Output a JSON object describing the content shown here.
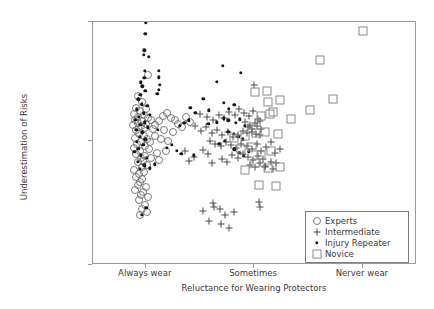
{
  "chart_data": {
    "type": "scatter",
    "title": "",
    "xlabel": "Reluctance for Wearing Protectors",
    "ylabel": "Underestimation of Risks",
    "xticklabels": [
      "Always wear",
      "Sometimes",
      "Nerver wear"
    ],
    "xtickpos": [
      0.163,
      0.497,
      0.833
    ],
    "yticklabels": [
      "Don't care",
      "So-so",
      "Very Careful"
    ],
    "ytickpos": [
      1.0,
      0.51,
      0.0
    ],
    "xlim": [
      0,
      1
    ],
    "ylim": [
      0,
      1
    ],
    "grid": false,
    "legend_position": "bottom-right",
    "series": [
      {
        "name": "Experts",
        "marker": "open-circle",
        "color": "#7a7a7a",
        "points": [
          [
            0.17,
            0.78
          ],
          [
            0.14,
            0.695
          ],
          [
            0.152,
            0.672
          ],
          [
            0.133,
            0.648
          ],
          [
            0.163,
            0.64
          ],
          [
            0.146,
            0.632
          ],
          [
            0.128,
            0.622
          ],
          [
            0.158,
            0.618
          ],
          [
            0.14,
            0.61
          ],
          [
            0.171,
            0.606
          ],
          [
            0.131,
            0.598
          ],
          [
            0.152,
            0.592
          ],
          [
            0.138,
            0.585
          ],
          [
            0.165,
            0.58
          ],
          [
            0.124,
            0.576
          ],
          [
            0.147,
            0.57
          ],
          [
            0.16,
            0.562
          ],
          [
            0.134,
            0.556
          ],
          [
            0.179,
            0.598
          ],
          [
            0.192,
            0.578
          ],
          [
            0.186,
            0.56
          ],
          [
            0.205,
            0.592
          ],
          [
            0.215,
            0.612
          ],
          [
            0.228,
            0.626
          ],
          [
            0.24,
            0.604
          ],
          [
            0.253,
            0.596
          ],
          [
            0.262,
            0.58
          ],
          [
            0.275,
            0.566
          ],
          [
            0.288,
            0.61
          ],
          [
            0.3,
            0.588
          ],
          [
            0.143,
            0.54
          ],
          [
            0.156,
            0.532
          ],
          [
            0.129,
            0.524
          ],
          [
            0.168,
            0.518
          ],
          [
            0.148,
            0.508
          ],
          [
            0.136,
            0.498
          ],
          [
            0.159,
            0.49
          ],
          [
            0.126,
            0.482
          ],
          [
            0.172,
            0.476
          ],
          [
            0.145,
            0.468
          ],
          [
            0.133,
            0.456
          ],
          [
            0.16,
            0.45
          ],
          [
            0.147,
            0.44
          ],
          [
            0.155,
            0.43
          ],
          [
            0.138,
            0.422
          ],
          [
            0.166,
            0.412
          ],
          [
            0.15,
            0.402
          ],
          [
            0.128,
            0.392
          ],
          [
            0.158,
            0.384
          ],
          [
            0.142,
            0.374
          ],
          [
            0.133,
            0.362
          ],
          [
            0.152,
            0.352
          ],
          [
            0.146,
            0.34
          ],
          [
            0.139,
            0.33
          ],
          [
            0.163,
            0.322
          ],
          [
            0.131,
            0.31
          ],
          [
            0.155,
            0.3
          ],
          [
            0.148,
            0.288
          ],
          [
            0.169,
            0.278
          ],
          [
            0.141,
            0.268
          ],
          [
            0.21,
            0.52
          ],
          [
            0.232,
            0.512
          ],
          [
            0.248,
            0.546
          ],
          [
            0.196,
            0.462
          ],
          [
            0.225,
            0.47
          ],
          [
            0.18,
            0.44
          ],
          [
            0.204,
            0.432
          ],
          [
            0.175,
            0.506
          ],
          [
            0.19,
            0.53
          ],
          [
            0.218,
            0.554
          ],
          [
            0.16,
            0.248
          ],
          [
            0.15,
            0.232
          ],
          [
            0.168,
            0.22
          ],
          [
            0.145,
            0.206
          ]
        ]
      },
      {
        "name": "Intermediate",
        "marker": "plus",
        "color": "#4a4a4a",
        "points": [
          [
            0.498,
            0.74
          ],
          [
            0.33,
            0.62
          ],
          [
            0.352,
            0.608
          ],
          [
            0.37,
            0.596
          ],
          [
            0.388,
            0.616
          ],
          [
            0.405,
            0.604
          ],
          [
            0.42,
            0.63
          ],
          [
            0.438,
            0.618
          ],
          [
            0.452,
            0.64
          ],
          [
            0.466,
            0.624
          ],
          [
            0.48,
            0.612
          ],
          [
            0.494,
            0.632
          ],
          [
            0.508,
            0.6
          ],
          [
            0.47,
            0.588
          ],
          [
            0.486,
            0.576
          ],
          [
            0.5,
            0.584
          ],
          [
            0.514,
            0.592
          ],
          [
            0.478,
            0.566
          ],
          [
            0.492,
            0.558
          ],
          [
            0.506,
            0.572
          ],
          [
            0.52,
            0.56
          ],
          [
            0.462,
            0.552
          ],
          [
            0.476,
            0.544
          ],
          [
            0.49,
            0.548
          ],
          [
            0.504,
            0.54
          ],
          [
            0.516,
            0.536
          ],
          [
            0.448,
            0.536
          ],
          [
            0.432,
            0.528
          ],
          [
            0.416,
            0.546
          ],
          [
            0.398,
            0.534
          ],
          [
            0.382,
            0.556
          ],
          [
            0.366,
            0.542
          ],
          [
            0.348,
            0.566
          ],
          [
            0.332,
            0.55
          ],
          [
            0.316,
            0.572
          ],
          [
            0.36,
            0.512
          ],
          [
            0.378,
            0.5
          ],
          [
            0.394,
            0.49
          ],
          [
            0.41,
            0.506
          ],
          [
            0.426,
            0.494
          ],
          [
            0.442,
            0.482
          ],
          [
            0.458,
            0.5
          ],
          [
            0.474,
            0.488
          ],
          [
            0.49,
            0.476
          ],
          [
            0.506,
            0.496
          ],
          [
            0.52,
            0.47
          ],
          [
            0.534,
            0.486
          ],
          [
            0.548,
            0.508
          ],
          [
            0.562,
            0.462
          ],
          [
            0.576,
            0.476
          ],
          [
            0.43,
            0.452
          ],
          [
            0.446,
            0.442
          ],
          [
            0.462,
            0.458
          ],
          [
            0.478,
            0.446
          ],
          [
            0.494,
            0.434
          ],
          [
            0.51,
            0.45
          ],
          [
            0.526,
            0.438
          ],
          [
            0.398,
            0.436
          ],
          [
            0.414,
            0.424
          ],
          [
            0.368,
            0.42
          ],
          [
            0.484,
            0.412
          ],
          [
            0.5,
            0.404
          ],
          [
            0.516,
            0.418
          ],
          [
            0.532,
            0.408
          ],
          [
            0.548,
            0.424
          ],
          [
            0.296,
            0.43
          ],
          [
            0.312,
            0.446
          ],
          [
            0.284,
            0.468
          ],
          [
            0.34,
            0.474
          ],
          [
            0.356,
            0.456
          ],
          [
            0.37,
            0.256
          ],
          [
            0.372,
            0.24
          ],
          [
            0.392,
            0.232
          ],
          [
            0.34,
            0.222
          ],
          [
            0.408,
            0.206
          ],
          [
            0.436,
            0.22
          ],
          [
            0.358,
            0.18
          ],
          [
            0.396,
            0.168
          ],
          [
            0.42,
            0.152
          ],
          [
            0.512,
            0.258
          ],
          [
            0.514,
            0.24
          ],
          [
            0.532,
            0.402
          ],
          [
            0.556,
            0.396
          ],
          [
            0.566,
            0.418
          ]
        ]
      },
      {
        "name": "Injury Repeater",
        "marker": "filled-dot",
        "color": "#1a1a1a",
        "points": [
          [
            0.163,
            0.998
          ],
          [
            0.162,
            0.952
          ],
          [
            0.158,
            0.884
          ],
          [
            0.156,
            0.866
          ],
          [
            0.172,
            0.858
          ],
          [
            0.16,
            0.8
          ],
          [
            0.158,
            0.77
          ],
          [
            0.204,
            0.798
          ],
          [
            0.204,
            0.772
          ],
          [
            0.148,
            0.752
          ],
          [
            0.152,
            0.736
          ],
          [
            0.206,
            0.742
          ],
          [
            0.162,
            0.716
          ],
          [
            0.204,
            0.72
          ],
          [
            0.146,
            0.7
          ],
          [
            0.14,
            0.682
          ],
          [
            0.198,
            0.704
          ],
          [
            0.15,
            0.662
          ],
          [
            0.168,
            0.656
          ],
          [
            0.136,
            0.64
          ],
          [
            0.156,
            0.624
          ],
          [
            0.142,
            0.61
          ],
          [
            0.176,
            0.618
          ],
          [
            0.13,
            0.598
          ],
          [
            0.16,
            0.588
          ],
          [
            0.146,
            0.576
          ],
          [
            0.17,
            0.566
          ],
          [
            0.134,
            0.556
          ],
          [
            0.152,
            0.546
          ],
          [
            0.144,
            0.528
          ],
          [
            0.162,
            0.518
          ],
          [
            0.136,
            0.506
          ],
          [
            0.155,
            0.494
          ],
          [
            0.14,
            0.478
          ],
          [
            0.128,
            0.466
          ],
          [
            0.148,
            0.452
          ],
          [
            0.166,
            0.44
          ],
          [
            0.138,
            0.424
          ],
          [
            0.158,
            0.41
          ],
          [
            0.144,
            0.396
          ],
          [
            0.4,
            0.82
          ],
          [
            0.456,
            0.79
          ],
          [
            0.382,
            0.754
          ],
          [
            0.34,
            0.684
          ],
          [
            0.3,
            0.648
          ],
          [
            0.358,
            0.636
          ],
          [
            0.316,
            0.626
          ],
          [
            0.42,
            0.642
          ],
          [
            0.436,
            0.66
          ],
          [
            0.404,
            0.668
          ],
          [
            0.404,
            0.604
          ],
          [
            0.418,
            0.596
          ],
          [
            0.382,
            0.588
          ],
          [
            0.356,
            0.582
          ],
          [
            0.268,
            0.572
          ],
          [
            0.282,
            0.584
          ],
          [
            0.296,
            0.596
          ],
          [
            0.44,
            0.586
          ],
          [
            0.454,
            0.6
          ],
          [
            0.468,
            0.572
          ],
          [
            0.418,
            0.548
          ],
          [
            0.434,
            0.54
          ],
          [
            0.448,
            0.528
          ],
          [
            0.462,
            0.518
          ],
          [
            0.406,
            0.512
          ],
          [
            0.39,
            0.5
          ],
          [
            0.228,
            0.482
          ],
          [
            0.244,
            0.494
          ],
          [
            0.258,
            0.47
          ],
          [
            0.272,
            0.458
          ],
          [
            0.436,
            0.476
          ],
          [
            0.452,
            0.462
          ],
          [
            0.466,
            0.45
          ],
          [
            0.48,
            0.468
          ],
          [
            0.312,
            0.452
          ],
          [
            0.19,
            0.414
          ],
          [
            0.176,
            0.398
          ],
          [
            0.15,
            0.206
          ],
          [
            0.164,
            0.236
          ],
          [
            0.2,
            0.556
          ]
        ]
      },
      {
        "name": "Novice",
        "marker": "open-square",
        "color": "#8a8a8a",
        "points": [
          [
            0.834,
            0.962
          ],
          [
            0.702,
            0.844
          ],
          [
            0.742,
            0.682
          ],
          [
            0.67,
            0.638
          ],
          [
            0.612,
            0.6
          ],
          [
            0.576,
            0.68
          ],
          [
            0.54,
            0.672
          ],
          [
            0.536,
            0.716
          ],
          [
            0.5,
            0.71
          ],
          [
            0.546,
            0.62
          ],
          [
            0.52,
            0.614
          ],
          [
            0.556,
            0.628
          ],
          [
            0.57,
            0.54
          ],
          [
            0.532,
            0.548
          ],
          [
            0.502,
            0.542
          ],
          [
            0.47,
            0.53
          ],
          [
            0.436,
            0.524
          ],
          [
            0.456,
            0.478
          ],
          [
            0.49,
            0.486
          ],
          [
            0.548,
            0.468
          ],
          [
            0.52,
            0.452
          ],
          [
            0.5,
            0.42
          ],
          [
            0.54,
            0.398
          ],
          [
            0.578,
            0.404
          ],
          [
            0.468,
            0.392
          ],
          [
            0.512,
            0.33
          ],
          [
            0.566,
            0.326
          ]
        ]
      }
    ]
  },
  "legend": {
    "entries": [
      {
        "label": "Experts",
        "marker": "open-circle"
      },
      {
        "label": "Intermediate",
        "marker": "plus"
      },
      {
        "label": "Injury Repeater",
        "marker": "filled-dot"
      },
      {
        "label": "Novice",
        "marker": "open-square"
      }
    ]
  }
}
